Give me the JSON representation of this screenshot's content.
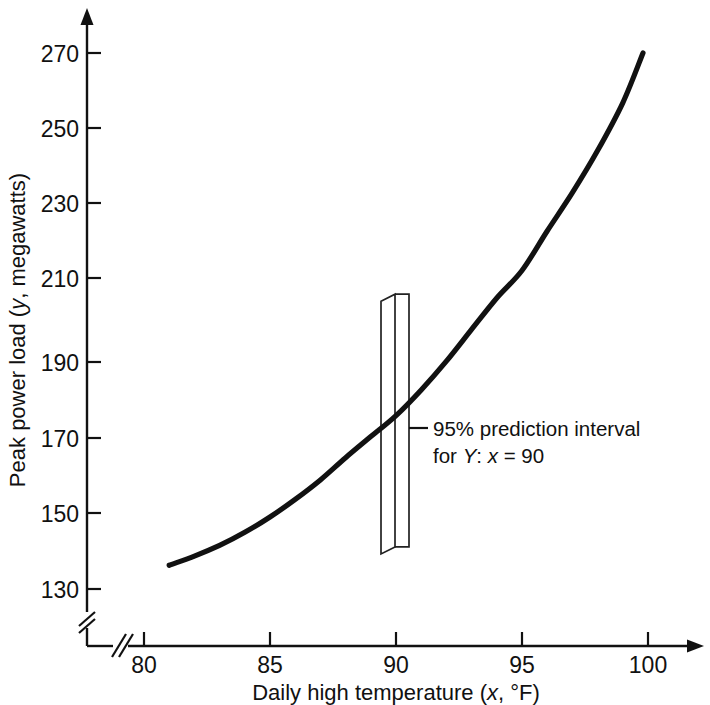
{
  "chart_data": {
    "type": "line",
    "title": "",
    "subtitle": "",
    "xlabel_parts": {
      "pre": "Daily high temperature (",
      "ital": "x",
      "post": ", °F)"
    },
    "xlabel": "Daily high temperature (x, °F)",
    "ylabel_parts": {
      "pre": "Peak power load (",
      "ital": "y",
      "post": ", megawatts)"
    },
    "ylabel": "Peak power load (y, megawatts)",
    "xlim": [
      78.8,
      101.5
    ],
    "ylim": [
      126,
      282
    ],
    "x_ticks": [
      80,
      85,
      90,
      95,
      100
    ],
    "x_tick_labels": [
      "80",
      "85",
      "90",
      "95",
      "100"
    ],
    "y_ticks": [
      130,
      150,
      170,
      190,
      210,
      230,
      250,
      270
    ],
    "y_tick_labels": [
      "130",
      "150",
      "170",
      "190",
      "210",
      "230",
      "250",
      "270"
    ],
    "grid": false,
    "legend": "none",
    "axis_break_x": true,
    "axis_break_y": true,
    "series": [
      {
        "name": "Fitted quadratic regression of peak power load on temperature",
        "x": [
          81,
          82,
          83,
          84,
          85,
          86,
          87,
          88,
          89,
          90,
          91,
          92,
          93,
          94,
          95,
          96,
          97,
          98,
          99,
          99.8
        ],
        "values": [
          136.2,
          138.6,
          141.4,
          144.8,
          148.8,
          153.4,
          158.5,
          164.3,
          169.8,
          175.3,
          182.0,
          189.5,
          197.8,
          206.0,
          213.2,
          223.5,
          233.5,
          244.5,
          257.0,
          270.0
        ]
      }
    ],
    "annotations": [
      {
        "name": "prediction-interval",
        "line1_parts": {
          "text": "95% prediction interval"
        },
        "line2_parts": {
          "pre": "for ",
          "ital1": "Y",
          "mid": ": ",
          "ital2": "x",
          "post": " = 90"
        },
        "line1": "95% prediction interval",
        "line2": "for Y: x = 90",
        "at_x": 90,
        "interval_low": 141,
        "interval_high": 207
      }
    ],
    "colors": {
      "curve": "#111111",
      "axis": "#111111",
      "interval_box": "#222222",
      "background": "#ffffff"
    }
  }
}
